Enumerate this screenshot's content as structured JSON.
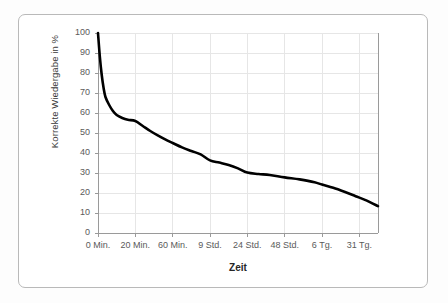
{
  "chart_data": {
    "type": "line",
    "title": "",
    "subtitle": "",
    "xlabel": "Zeit",
    "ylabel": "Korrekte Wiedergabe in %",
    "categories": [
      "0 Min.",
      "20 Min.",
      "60 Min.",
      "9 Std.",
      "24 Std.",
      "48 Std.",
      "6 Tg.",
      "31 Tg."
    ],
    "x": [
      0,
      1,
      2,
      3,
      4,
      5,
      6,
      7
    ],
    "values": [
      100,
      56,
      45,
      36,
      30,
      28,
      24,
      13
    ],
    "series": [
      {
        "name": "Korrekte Wiedergabe",
        "color": "#000000",
        "values": [
          100,
          56,
          45,
          36,
          30,
          28,
          24,
          13
        ]
      }
    ],
    "curve_points": [
      [
        0.0,
        100.0
      ],
      [
        0.05,
        88.0
      ],
      [
        0.1,
        79.0
      ],
      [
        0.15,
        72.5
      ],
      [
        0.2,
        68.0
      ],
      [
        0.3,
        64.0
      ],
      [
        0.4,
        61.0
      ],
      [
        0.5,
        59.0
      ],
      [
        0.65,
        57.5
      ],
      [
        0.8,
        56.6
      ],
      [
        1.0,
        56.0
      ],
      [
        1.2,
        53.5
      ],
      [
        1.4,
        51.0
      ],
      [
        1.6,
        48.8
      ],
      [
        1.8,
        46.8
      ],
      [
        2.0,
        45.0
      ],
      [
        2.25,
        42.8
      ],
      [
        2.5,
        41.0
      ],
      [
        2.75,
        39.3
      ],
      [
        3.0,
        36.3
      ],
      [
        3.25,
        35.2
      ],
      [
        3.5,
        34.0
      ],
      [
        3.75,
        32.3
      ],
      [
        4.0,
        30.2
      ],
      [
        4.3,
        29.5
      ],
      [
        4.6,
        29.0
      ],
      [
        5.0,
        27.8
      ],
      [
        5.4,
        26.8
      ],
      [
        5.8,
        25.4
      ],
      [
        6.0,
        24.2
      ],
      [
        6.3,
        22.6
      ],
      [
        6.6,
        20.6
      ],
      [
        6.9,
        18.4
      ],
      [
        7.2,
        16.2
      ],
      [
        7.5,
        13.4
      ]
    ],
    "ylim": [
      0,
      100
    ],
    "ytick_values": [
      0,
      10,
      20,
      30,
      40,
      50,
      60,
      70,
      80,
      90,
      100
    ],
    "xlim": [
      0,
      7.5
    ],
    "grid": true,
    "grid_color": "#e3e3e3",
    "legend": "none",
    "legend_position": "none",
    "line_width": 2.6,
    "axis_color": "#9a9a9a",
    "background": "#ffffff"
  },
  "frame": {
    "border_color": "#b9b9b9",
    "background": "#ffffff"
  }
}
